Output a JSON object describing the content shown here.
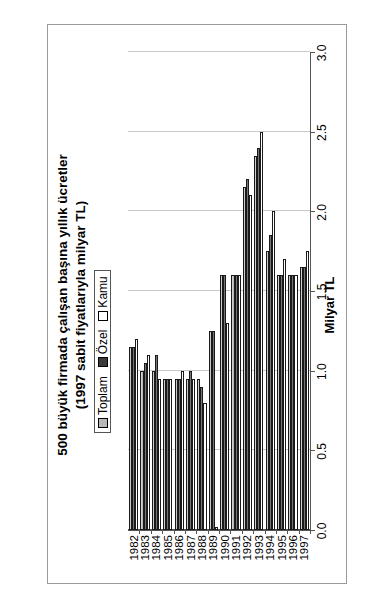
{
  "page": {
    "annotation_main": "EK 2/J",
    "annotation_sub": "(3)"
  },
  "chart_data": {
    "type": "bar",
    "orientation": "horizontal-rotated",
    "title": "500 büyük firmada çalışan başına yıllık ücretler",
    "subtitle": "(1997 sabit fiyatlarıyla milyar TL)",
    "xlabel": "",
    "ylabel": "Milyar TL",
    "ylim": [
      0.0,
      3.0
    ],
    "ytick_labels": [
      "3.0",
      "2.5",
      "2.0",
      "1.5",
      "1.0",
      "0.5",
      "0.0"
    ],
    "ytick_values": [
      3.0,
      2.5,
      2.0,
      1.5,
      1.0,
      0.5,
      0.0
    ],
    "grid": true,
    "legend_position": "upper-left",
    "categories": [
      "1982",
      "1983",
      "1984",
      "1985",
      "1986",
      "1987",
      "1988",
      "1989",
      "1990",
      "1991",
      "1992",
      "1993",
      "1994",
      "1995",
      "1996",
      "1997"
    ],
    "series": [
      {
        "name": "Toplam",
        "color": "#b8b8b8",
        "values": [
          1.15,
          1.0,
          1.0,
          0.95,
          0.95,
          0.95,
          0.95,
          1.25,
          1.6,
          1.6,
          2.15,
          2.35,
          1.75,
          1.6,
          1.6,
          1.65
        ]
      },
      {
        "name": "Özel",
        "color": "#3a3a3a",
        "values": [
          1.15,
          1.05,
          1.1,
          0.95,
          0.95,
          1.0,
          0.9,
          1.25,
          1.6,
          1.6,
          2.2,
          2.4,
          1.85,
          1.6,
          1.6,
          1.65
        ]
      },
      {
        "name": "Kamu",
        "color": "#ffffff",
        "values": [
          1.2,
          1.1,
          0.95,
          0.95,
          1.0,
          0.95,
          0.8,
          0.02,
          1.3,
          1.6,
          2.1,
          2.5,
          2.0,
          1.7,
          1.6,
          1.75
        ]
      }
    ]
  }
}
